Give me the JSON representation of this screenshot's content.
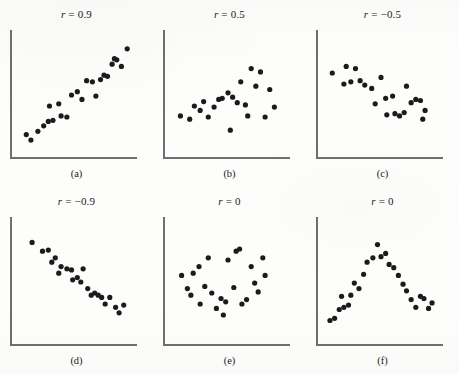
{
  "figure": {
    "background_color": "#fdfdfc",
    "dot_color": "#1b1b1b",
    "axis_color": "#6f6f6f"
  },
  "chart_data": [
    {
      "type": "scatter",
      "title": "r = 0.9",
      "title_symbol": "r",
      "title_value": "= 0.9",
      "caption": "(a)",
      "r": 0.9,
      "xlabel": "",
      "ylabel": "",
      "xlim": [
        0,
        100
      ],
      "ylim": [
        0,
        100
      ],
      "grid": false,
      "legend": "none",
      "points": [
        [
          8,
          14
        ],
        [
          12,
          9
        ],
        [
          18,
          17
        ],
        [
          23,
          22
        ],
        [
          27,
          26
        ],
        [
          31,
          27
        ],
        [
          28,
          40
        ],
        [
          36,
          42
        ],
        [
          38,
          31
        ],
        [
          43,
          30
        ],
        [
          47,
          50
        ],
        [
          52,
          53
        ],
        [
          56,
          46
        ],
        [
          60,
          63
        ],
        [
          65,
          62
        ],
        [
          68,
          49
        ],
        [
          72,
          64
        ],
        [
          75,
          68
        ],
        [
          78,
          67
        ],
        [
          82,
          78
        ],
        [
          84,
          83
        ],
        [
          86,
          82
        ],
        [
          90,
          76
        ],
        [
          95,
          92
        ]
      ]
    },
    {
      "type": "scatter",
      "title": "r = 0.5",
      "title_symbol": "r",
      "title_value": "= 0.5",
      "caption": "(b)",
      "r": 0.5,
      "xlabel": "",
      "ylabel": "",
      "xlim": [
        0,
        100
      ],
      "ylim": [
        0,
        100
      ],
      "grid": false,
      "legend": "none",
      "points": [
        [
          9,
          31
        ],
        [
          17,
          28
        ],
        [
          21,
          40
        ],
        [
          26,
          36
        ],
        [
          29,
          44
        ],
        [
          33,
          30
        ],
        [
          38,
          39
        ],
        [
          42,
          46
        ],
        [
          45,
          47
        ],
        [
          50,
          52
        ],
        [
          54,
          48
        ],
        [
          52,
          18
        ],
        [
          58,
          43
        ],
        [
          61,
          62
        ],
        [
          65,
          41
        ],
        [
          67,
          31
        ],
        [
          70,
          74
        ],
        [
          74,
          58
        ],
        [
          78,
          71
        ],
        [
          82,
          30
        ],
        [
          86,
          55
        ],
        [
          90,
          39
        ]
      ]
    },
    {
      "type": "scatter",
      "title": "r = −0.5",
      "title_symbol": "r",
      "title_value": "= −0.5",
      "caption": "(c)",
      "r": -0.5,
      "xlabel": "",
      "ylabel": "",
      "xlim": [
        0,
        100
      ],
      "ylim": [
        0,
        100
      ],
      "grid": false,
      "legend": "none",
      "points": [
        [
          8,
          70
        ],
        [
          20,
          76
        ],
        [
          18,
          60
        ],
        [
          24,
          62
        ],
        [
          28,
          74
        ],
        [
          32,
          63
        ],
        [
          36,
          59
        ],
        [
          42,
          56
        ],
        [
          45,
          42
        ],
        [
          50,
          66
        ],
        [
          54,
          47
        ],
        [
          55,
          32
        ],
        [
          60,
          49
        ],
        [
          62,
          33
        ],
        [
          66,
          31
        ],
        [
          70,
          34
        ],
        [
          72,
          58
        ],
        [
          76,
          43
        ],
        [
          80,
          46
        ],
        [
          84,
          45
        ],
        [
          86,
          28
        ],
        [
          88,
          36
        ]
      ]
    },
    {
      "type": "scatter",
      "title": "r = −0.9",
      "title_symbol": "r",
      "title_value": "= −0.9",
      "caption": "(d)",
      "r": -0.9,
      "xlabel": "",
      "ylabel": "",
      "xlim": [
        0,
        100
      ],
      "ylim": [
        0,
        100
      ],
      "grid": false,
      "legend": "none",
      "points": [
        [
          13,
          86
        ],
        [
          22,
          78
        ],
        [
          27,
          79
        ],
        [
          30,
          68
        ],
        [
          33,
          72
        ],
        [
          38,
          64
        ],
        [
          36,
          58
        ],
        [
          43,
          62
        ],
        [
          47,
          61
        ],
        [
          48,
          52
        ],
        [
          52,
          54
        ],
        [
          55,
          50
        ],
        [
          57,
          62
        ],
        [
          61,
          44
        ],
        [
          64,
          38
        ],
        [
          67,
          40
        ],
        [
          70,
          38
        ],
        [
          73,
          36
        ],
        [
          76,
          30
        ],
        [
          80,
          36
        ],
        [
          85,
          27
        ],
        [
          88,
          22
        ],
        [
          92,
          29
        ]
      ]
    },
    {
      "type": "scatter",
      "title": "r = 0",
      "title_symbol": "r",
      "title_value": "= 0",
      "caption": "(e)",
      "r": 0,
      "xlabel": "",
      "ylabel": "",
      "xlim": [
        0,
        100
      ],
      "ylim": [
        0,
        100
      ],
      "grid": false,
      "legend": "none",
      "points": [
        [
          10,
          56
        ],
        [
          15,
          44
        ],
        [
          18,
          38
        ],
        [
          20,
          58
        ],
        [
          25,
          64
        ],
        [
          26,
          30
        ],
        [
          30,
          46
        ],
        [
          33,
          72
        ],
        [
          36,
          40
        ],
        [
          40,
          26
        ],
        [
          44,
          35
        ],
        [
          46,
          20
        ],
        [
          48,
          32
        ],
        [
          50,
          70
        ],
        [
          55,
          45
        ],
        [
          57,
          78
        ],
        [
          60,
          80
        ],
        [
          62,
          30
        ],
        [
          66,
          34
        ],
        [
          70,
          64
        ],
        [
          73,
          49
        ],
        [
          76,
          41
        ],
        [
          80,
          72
        ],
        [
          82,
          56
        ]
      ]
    },
    {
      "type": "scatter",
      "title": "r = 0",
      "title_symbol": "r",
      "title_value": "= 0",
      "caption": "(f)",
      "r": 0,
      "xlabel": "",
      "ylabel": "",
      "xlim": [
        0,
        100
      ],
      "ylim": [
        0,
        100
      ],
      "grid": false,
      "legend": "none",
      "points": [
        [
          6,
          15
        ],
        [
          10,
          17
        ],
        [
          14,
          25
        ],
        [
          18,
          27
        ],
        [
          22,
          29
        ],
        [
          16,
          37
        ],
        [
          24,
          38
        ],
        [
          27,
          49
        ],
        [
          31,
          44
        ],
        [
          35,
          57
        ],
        [
          38,
          68
        ],
        [
          43,
          72
        ],
        [
          47,
          84
        ],
        [
          50,
          73
        ],
        [
          54,
          76
        ],
        [
          57,
          66
        ],
        [
          61,
          63
        ],
        [
          65,
          56
        ],
        [
          69,
          48
        ],
        [
          72,
          42
        ],
        [
          76,
          34
        ],
        [
          80,
          27
        ],
        [
          84,
          37
        ],
        [
          87,
          35
        ],
        [
          91,
          26
        ],
        [
          94,
          31
        ]
      ]
    }
  ]
}
